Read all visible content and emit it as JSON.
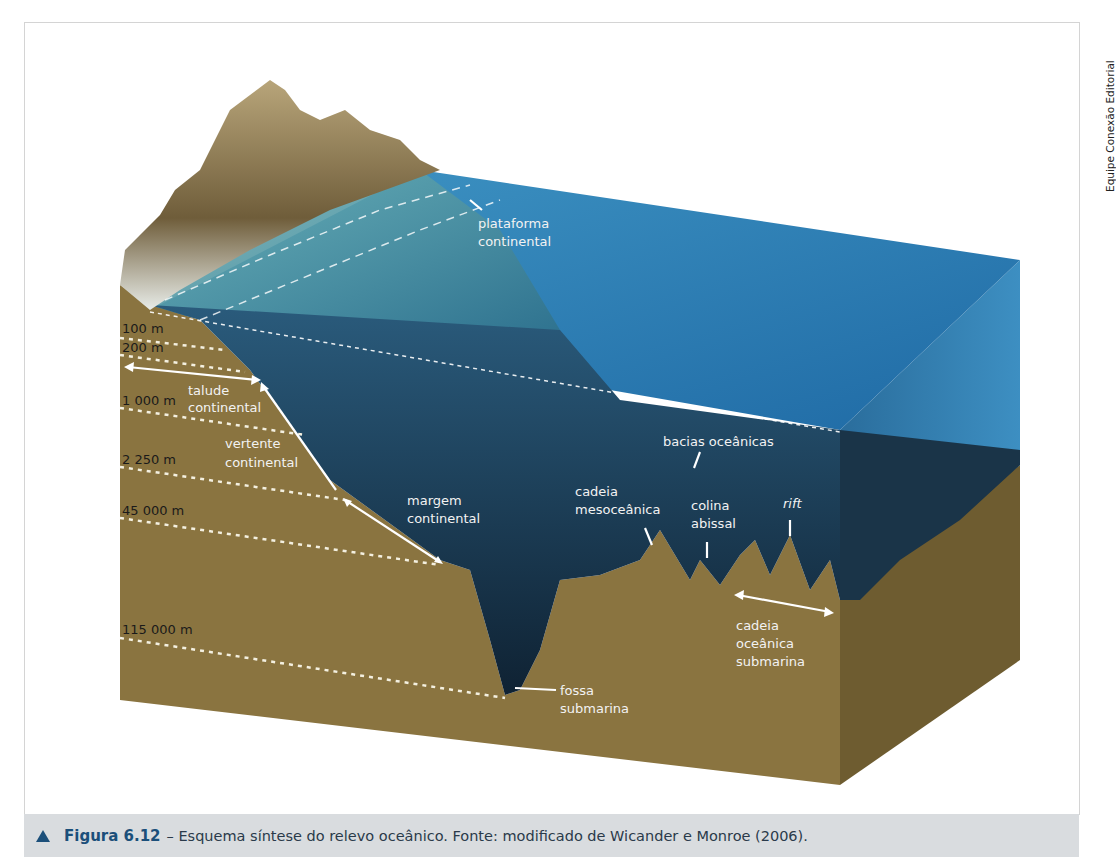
{
  "credit": "Equipe Conexão Editorial",
  "caption": {
    "figure_label": "Figura 6.12",
    "text": " – Esquema síntese do relevo oceânico. Fonte: modificado de Wicander e Monroe (2006)."
  },
  "depths": [
    "100 m",
    "200 m",
    "1 000 m",
    "2 250 m",
    "45 000 m",
    "115 000 m"
  ],
  "labels": {
    "plataforma": [
      "plataforma",
      "continental"
    ],
    "talude": [
      "talude",
      "continental"
    ],
    "vertente": [
      "vertente",
      "continental"
    ],
    "margem": [
      "margem",
      "continental"
    ],
    "cadeia_meso": [
      "cadeia",
      "mesoceânica"
    ],
    "bacias": "bacias oceânicas",
    "colina": [
      "colina",
      "abissal"
    ],
    "rift": "rift",
    "cadeia_sub": [
      "cadeia",
      "oceânica",
      "submarina"
    ],
    "fossa": [
      "fossa",
      "submarina"
    ]
  },
  "colors": {
    "sediment": "#8a7440",
    "ocean_surface": "#2c7fb8",
    "deep_water": "#16324a",
    "caption_bg": "#d9dcdf",
    "caption_accent": "#1b4f7a"
  }
}
